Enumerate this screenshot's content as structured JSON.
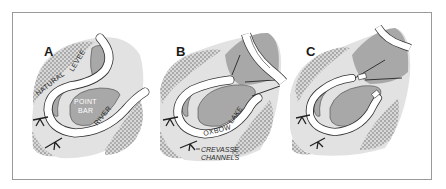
{
  "figure": {
    "panels": [
      {
        "id": "A",
        "label": "A",
        "annotations": {
          "levee": "NATURAL LEVEE",
          "levee_word1": "NATURAL",
          "levee_word2": "LEVEE",
          "point_bar_line1": "POINT",
          "point_bar_line2": "BAR",
          "river": "RIVER"
        }
      },
      {
        "id": "B",
        "label": "B",
        "annotations": {
          "oxbow": "OXBOW",
          "lake": "LAKE",
          "crevasse_line1": "CREVASSE",
          "crevasse_line2": "CHANNELS"
        }
      },
      {
        "id": "C",
        "label": "C",
        "annotations": {}
      }
    ],
    "colors": {
      "frame_border": "#9a9a9a",
      "floodplain_light": "#e2e2e2",
      "levee_mid": "#c4c4c4",
      "point_bar_dark": "#a8a8a8",
      "stipple": "#8c8c8c",
      "water": "#ffffff",
      "outline": "#333333"
    }
  }
}
